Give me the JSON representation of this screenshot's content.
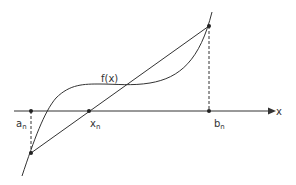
{
  "diagram": {
    "function_label": "f(x)",
    "axis_label": "x",
    "points": {
      "a": {
        "base": "a",
        "sub": "n"
      },
      "x": {
        "base": "x",
        "sub": "n"
      },
      "b": {
        "base": "b",
        "sub": "n"
      }
    },
    "colors": {
      "stroke": "#333333",
      "background": "#ffffff"
    }
  }
}
